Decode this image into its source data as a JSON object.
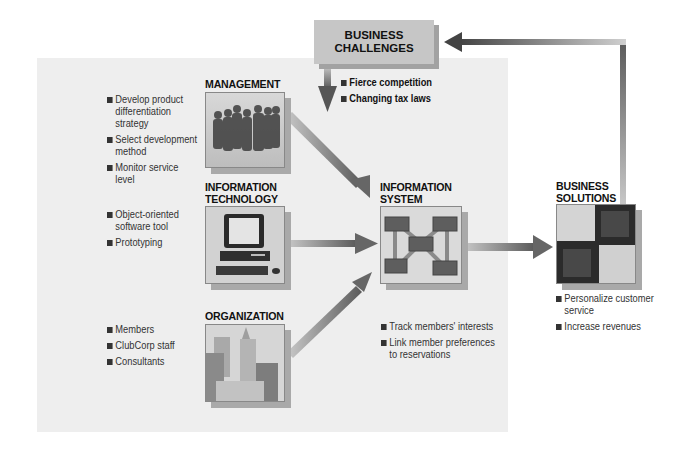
{
  "challenges": {
    "title_line1": "BUSINESS",
    "title_line2": "CHALLENGES",
    "items": [
      "Fierce competition",
      "Changing tax laws"
    ]
  },
  "management": {
    "title": "MANAGEMENT",
    "items": [
      [
        "Develop product",
        "differentiation",
        "strategy"
      ],
      [
        "Select development",
        "method"
      ],
      [
        "Monitor service",
        "level"
      ]
    ]
  },
  "technology": {
    "title_line1": "INFORMATION",
    "title_line2": "TECHNOLOGY",
    "items": [
      [
        "Object-oriented",
        "software tool"
      ],
      [
        "Prototyping"
      ]
    ]
  },
  "organization": {
    "title": "ORGANIZATION",
    "items": [
      [
        "Members"
      ],
      [
        "ClubCorp staff"
      ],
      [
        "Consultants"
      ]
    ]
  },
  "information_system": {
    "title_line1": "INFORMATION",
    "title_line2": "SYSTEM",
    "items": [
      [
        "Track members' interests"
      ],
      [
        "Link member preferences",
        "to reservations"
      ]
    ]
  },
  "solutions": {
    "title_line1": "BUSINESS",
    "title_line2": "SOLUTIONS",
    "items": [
      [
        "Personalize customer",
        "service"
      ],
      [
        "Increase revenues"
      ]
    ]
  },
  "colors": {
    "panel": "#eeeeee",
    "challenge_box": "#c6c6c6",
    "arrow_dark": "#555555",
    "arrow_light": "#c0c0c0"
  }
}
